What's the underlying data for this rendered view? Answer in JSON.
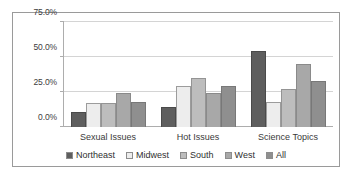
{
  "chart_data": {
    "type": "bar",
    "title": "",
    "xlabel": "",
    "ylabel": "",
    "ylim": [
      0,
      75
    ],
    "grid": true,
    "legend_position": "bottom",
    "categories": [
      "Sexual Issues",
      "Hot Issues",
      "Science Topics"
    ],
    "y_ticks": [
      "0.0%",
      "25.0%",
      "50.0%",
      "75.0%"
    ],
    "y_tick_values": [
      0,
      25,
      50,
      75
    ],
    "series": [
      {
        "name": "Northeast",
        "color": "#5e5e5e",
        "values": [
          11,
          14,
          54
        ]
      },
      {
        "name": "Midwest",
        "color": "#ededed",
        "values": [
          17,
          29,
          18
        ]
      },
      {
        "name": "South",
        "color": "#bdbdbd",
        "values": [
          17,
          35,
          27
        ]
      },
      {
        "name": "West",
        "color": "#a8a8a8",
        "values": [
          24,
          24,
          45
        ]
      },
      {
        "name": "All",
        "color": "#8f8f8f",
        "values": [
          18,
          29,
          33
        ]
      }
    ]
  }
}
